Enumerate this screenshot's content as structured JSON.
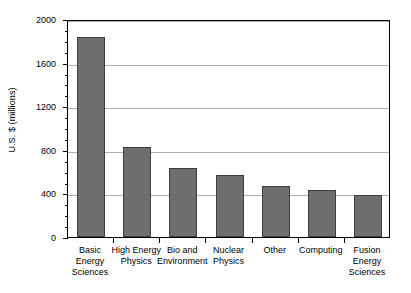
{
  "chart_data": {
    "type": "bar",
    "title": "",
    "xlabel": "",
    "ylabel": "U.S. $ (millions)",
    "ylim": [
      0,
      2000
    ],
    "ytick_labels": [
      "0",
      "400",
      "800",
      "1200",
      "1600",
      "2000"
    ],
    "ytick_values": [
      0,
      400,
      800,
      1200,
      1600,
      2000
    ],
    "minor_tick_interval": 100,
    "grid": "horizontal",
    "gridline_values": [
      400,
      800,
      1200,
      1600,
      2000
    ],
    "legend": "none",
    "bar_color": "#6e6e6e",
    "bar_edge_color": "#3d3d3d",
    "plot_background": "#ffffff",
    "axis_color": "#000000",
    "gridline_color": "#b0b0b0",
    "categories": [
      "Basic\nEnergy\nSciences",
      "High Energy\nPhysics",
      "Bio and\nEnvironment",
      "Nuclear\nPhysics",
      "Other",
      "Computing",
      "Fusion\nEnergy\nSciences"
    ],
    "values": [
      1835,
      830,
      630,
      565,
      470,
      435,
      385
    ]
  }
}
